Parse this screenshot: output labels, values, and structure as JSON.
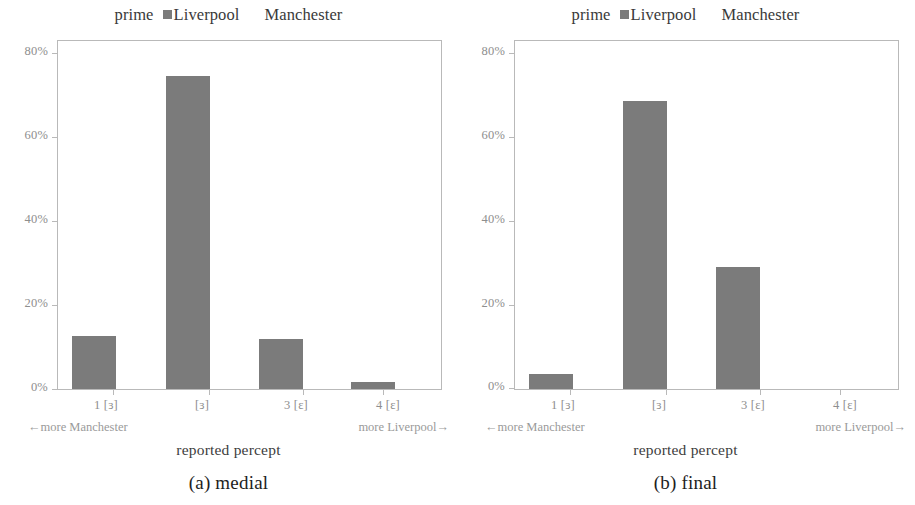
{
  "figure": {
    "legend": {
      "title": "prime",
      "entries": [
        {
          "label": "Liverpool",
          "swatch": "filled",
          "color": "#7b7b7b"
        },
        {
          "label": "Manchester",
          "swatch": "empty",
          "color": "#ffffff"
        }
      ]
    },
    "axis": {
      "ylabel": "% of cases",
      "xlabel": "reported percept",
      "yticks": [
        "0%",
        "20%",
        "40%",
        "60%",
        "80%"
      ],
      "xticks": [
        "1 [ɜ]",
        "[ɜ]",
        "3 [ɛ]",
        "4 [ɛ]"
      ],
      "x_end_left": "←more Manchester",
      "x_end_right": "more Liverpool→"
    },
    "panels": [
      {
        "caption": "(a) medial"
      },
      {
        "caption": "(b) final"
      }
    ]
  },
  "chart_data": [
    {
      "type": "bar",
      "title": "(a) medial",
      "categories": [
        "1 [ɜ]",
        "[ɜ]",
        "3 [ɛ]",
        "4 [ɛ]"
      ],
      "series": [
        {
          "name": "Liverpool",
          "values": [
            12.6,
            74.5,
            11.9,
            1.7
          ],
          "color": "#7b7b7b"
        },
        {
          "name": "Manchester",
          "values": [
            0,
            0,
            0,
            0
          ],
          "color": "#ffffff"
        }
      ],
      "xlabel": "reported percept",
      "ylabel": "% of cases",
      "ylim": [
        0,
        83
      ],
      "yticks": [
        0,
        20,
        40,
        60,
        80
      ],
      "ytick_labels": [
        "0%",
        "20%",
        "40%",
        "60%",
        "80%"
      ],
      "grid": false,
      "legend_position": "top-center",
      "annotations": [
        "←more Manchester",
        "more Liverpool→"
      ]
    },
    {
      "type": "bar",
      "title": "(b) final",
      "categories": [
        "1 [ɜ]",
        "[ɜ]",
        "3 [ɛ]",
        "4 [ɛ]"
      ],
      "series": [
        {
          "name": "Liverpool",
          "values": [
            3.6,
            68.4,
            28.9,
            0.0
          ],
          "color": "#7b7b7b"
        },
        {
          "name": "Manchester",
          "values": [
            0,
            0,
            0,
            0
          ],
          "color": "#ffffff"
        }
      ],
      "xlabel": "reported percept",
      "ylabel": "% of cases",
      "ylim": [
        0,
        83
      ],
      "yticks": [
        0,
        20,
        40,
        60,
        80
      ],
      "ytick_labels": [
        "0%",
        "20%",
        "40%",
        "60%",
        "80%"
      ],
      "grid": false,
      "legend_position": "top-center",
      "annotations": [
        "←more Manchester",
        "more Liverpool→"
      ]
    }
  ]
}
